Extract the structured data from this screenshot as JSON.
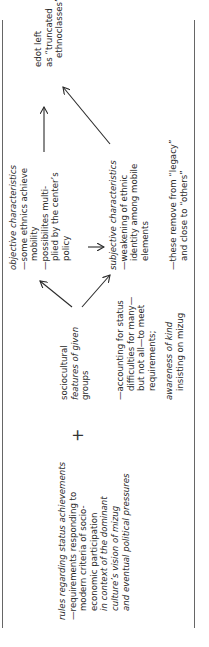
{
  "diagram": {
    "left_block": {
      "heading": "rules regarding status achievements",
      "lines": [
        "—requirements responding to",
        "modern criteria of socio-",
        "economic participation"
      ],
      "italic_lines": [
        "in context of the dominant",
        "culture’s vision of mizug",
        "and eventual political pressures"
      ]
    },
    "operator": "+",
    "middle_block": {
      "heading_line1": "sociocultural",
      "heading_line2": "features of given",
      "heading_line3": "groups",
      "accounting": [
        "—accounting for status",
        "difficulties for many—",
        "but not all—to meet",
        "requirements;"
      ],
      "awareness_line1": "awareness of kind",
      "awareness_line2": "insisting on mizug"
    },
    "objective_block": {
      "heading": "objective characteristics",
      "lines": [
        "—some ethnics achieve",
        "mobility",
        "—possibilites multi-",
        "plied by the center’s",
        "policy"
      ]
    },
    "subjective_block": {
      "heading": "subjective characteristics",
      "lines": [
        "—weakening of ethnic",
        "identity among mobile",
        "elements"
      ],
      "remove_lines": [
        "—these remove from “legacy”",
        "and close to “others”"
      ]
    },
    "result_block": {
      "lines": [
        "edot left",
        "as “truncated",
        "ethnoclasses”"
      ]
    },
    "arrows": [
      {
        "from": "sociocultural features",
        "to": "objective characteristics",
        "icon": "arrow-up-right-icon"
      },
      {
        "from": "sociocultural features",
        "to": "subjective characteristics",
        "icon": "arrow-down-right-icon"
      },
      {
        "from": "objective characteristics",
        "to": "subjective characteristics",
        "icon": "arrow-down-icon"
      },
      {
        "from": "objective characteristics",
        "to": "edot left",
        "icon": "arrow-right-icon"
      },
      {
        "from": "subjective characteristics",
        "to": "edot left",
        "icon": "arrow-up-right-icon"
      }
    ],
    "colors": {
      "text": "#2a2a2a",
      "rule": "#666666",
      "background": "#ffffff"
    }
  }
}
